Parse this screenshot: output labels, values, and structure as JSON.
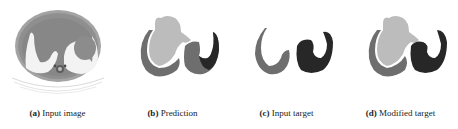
{
  "figure": {
    "panels": [
      {
        "id": "a",
        "label": "(a)",
        "title": "Input image"
      },
      {
        "id": "b",
        "label": "(b)",
        "title": "Prediction"
      },
      {
        "id": "c",
        "label": "(c)",
        "title": "Input target"
      },
      {
        "id": "d",
        "label": "(d)",
        "title": "Modified target"
      }
    ],
    "colors": {
      "light_region": "#bcbcbc",
      "mid_region": "#6e6e6e",
      "dark_region": "#272727",
      "ct_body": "#9a9a9a",
      "ct_bright": "#f2f2f2"
    }
  }
}
